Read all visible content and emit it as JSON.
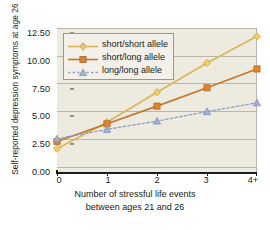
{
  "chart_data": {
    "type": "line",
    "title": "",
    "xlabel": "Number of stressful life events between ages 21 and 26",
    "xlabel_line1": "Number of stressful life events",
    "xlabel_line2": "between ages 21 and 26",
    "ylabel": "Self-reported depression symptoms at age 26",
    "categories": [
      "0",
      "1",
      "2",
      "3",
      "4+"
    ],
    "x": [
      0,
      1,
      2,
      3,
      4
    ],
    "ylim": [
      0.0,
      13.0
    ],
    "yticks": [
      "0.00",
      "2.50",
      "5.00",
      "7.50",
      "10.00",
      "12.50"
    ],
    "ytick_values": [
      0.0,
      2.5,
      5.0,
      7.5,
      10.0,
      12.5
    ],
    "grid": "horizontal",
    "legend_position": "top-left",
    "series": [
      {
        "name": "short/short allele",
        "values": [
          2.1,
          4.5,
          7.2,
          9.85,
          12.25
        ],
        "color": "#d9b65a",
        "marker": "diamond",
        "dash": "solid"
      },
      {
        "name": "short/long allele",
        "values": [
          2.75,
          4.35,
          5.95,
          7.6,
          9.3
        ],
        "color": "#c6762a",
        "marker": "square",
        "dash": "solid"
      },
      {
        "name": "long/long allele",
        "values": [
          3.0,
          3.85,
          4.6,
          5.45,
          6.25
        ],
        "color": "#8f9fc4",
        "marker": "triangle",
        "dash": "dashed"
      }
    ]
  },
  "legend": {
    "items": [
      {
        "label": "short/short allele"
      },
      {
        "label": "short/long allele"
      },
      {
        "label": "long/long allele"
      }
    ]
  },
  "axes": {
    "y_title": "Self-reported depression symptoms at age 26",
    "x_title_line1": "Number of stressful life events",
    "x_title_line2": "between ages 21 and 26",
    "y_labels": [
      "12.50",
      "10.00",
      "7.50",
      "5.00",
      "2.50",
      "0.00"
    ],
    "x_labels": [
      "0",
      "1",
      "2",
      "3",
      "4+"
    ]
  },
  "colors": {
    "plot_background": "#edeae0",
    "gridline": "#b9b6ac",
    "axis": "#1a1a1a",
    "series_short_short": "#d9b65a",
    "series_short_long": "#c6762a",
    "series_long_long": "#8f9fc4"
  }
}
